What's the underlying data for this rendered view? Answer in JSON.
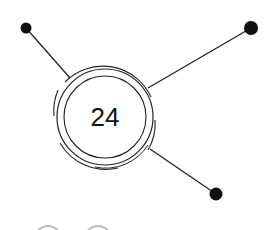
{
  "diagram": {
    "center": {
      "label": "24",
      "cx": 105,
      "cy": 117
    },
    "colors": {
      "stroke": "#222222",
      "node": "#111111",
      "background": "#ffffff"
    },
    "nodes": [
      {
        "name": "top-left",
        "x": 26,
        "y": 28,
        "r": 5.5
      },
      {
        "name": "top-right",
        "x": 251,
        "y": 28,
        "r": 7
      },
      {
        "name": "bottom-right",
        "x": 216,
        "y": 194,
        "r": 6.5
      }
    ]
  }
}
